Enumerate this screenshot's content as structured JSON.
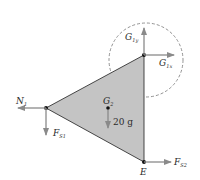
{
  "diagram": {
    "type": "free-body-diagram",
    "body": "triangle",
    "body_color": "#c4c4c4",
    "arrow_color": "#8a8a8a",
    "labels": {
      "g1y": {
        "main": "G",
        "sub": "1y"
      },
      "g1x": {
        "main": "G",
        "sub": "1x"
      },
      "n1": {
        "main": "N",
        "sub": "1"
      },
      "fs1": {
        "main": "F",
        "sub": "S1"
      },
      "g2": {
        "main": "G",
        "sub": "2"
      },
      "weight": "20 g",
      "fs2": {
        "main": "F",
        "sub": "S2"
      },
      "e": "E"
    }
  }
}
